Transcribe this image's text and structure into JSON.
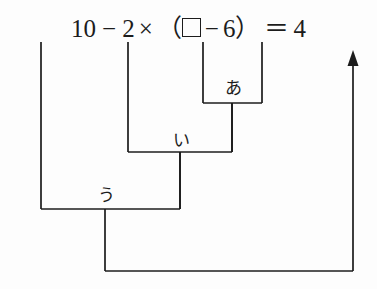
{
  "page": {
    "width": 377,
    "height": 289,
    "background_color": "#fdfdfd",
    "ink_color": "#1c1c1c"
  },
  "equation": {
    "full_text": "１０－２×（□－６）＝４",
    "tokens": [
      {
        "name": "digit-one",
        "text": "1",
        "type": "text",
        "x": 30,
        "width": 16
      },
      {
        "name": "digit-zero",
        "text": "0",
        "type": "text",
        "x": 48,
        "width": 18
      },
      {
        "name": "minus-sign-1",
        "text": "−",
        "type": "text",
        "x": 72,
        "width": 22
      },
      {
        "name": "digit-two",
        "text": "2",
        "type": "text",
        "x": 101,
        "width": 18
      },
      {
        "name": "multiply-sign",
        "text": "×",
        "type": "text",
        "x": 124,
        "width": 21
      },
      {
        "name": "paren-open",
        "text": "（",
        "type": "text",
        "x": 159,
        "width": 16
      },
      {
        "name": "answer-box",
        "text": "",
        "type": "box",
        "x": 194,
        "width": 19
      },
      {
        "name": "minus-sign-2",
        "text": "−",
        "type": "text",
        "x": 220,
        "width": 22
      },
      {
        "name": "digit-six",
        "text": "6",
        "type": "text",
        "x": 252,
        "width": 18
      },
      {
        "name": "paren-close",
        "text": "）",
        "type": "text",
        "x": 274,
        "width": 16
      },
      {
        "name": "equals-sign",
        "text": "＝",
        "type": "text",
        "x": 308,
        "width": 22
      },
      {
        "name": "digit-four",
        "text": "4",
        "type": "text",
        "x": 344,
        "width": 18
      }
    ]
  },
  "brackets": [
    {
      "name": "bracket-a",
      "label": "あ",
      "label_x": 233,
      "label_y": 88,
      "left_x": 203,
      "right_x": 262,
      "top_y": 42,
      "bottom_y": 103,
      "drop_x": 232,
      "drop_to_y": 152
    },
    {
      "name": "bracket-i",
      "label": "い",
      "label_x": 181,
      "label_y": 140,
      "left_x": 128,
      "right_x": 232,
      "top_y": 42,
      "bottom_y": 152,
      "drop_x": 180,
      "drop_to_y": 209
    },
    {
      "name": "bracket-u",
      "label": "う",
      "label_x": 106,
      "label_y": 195,
      "left_x": 41,
      "right_x": 180,
      "top_y": 42,
      "bottom_y": 209,
      "drop_x": 105,
      "drop_to_y": 271
    }
  ],
  "result_path": {
    "name": "result-arrow-path",
    "start_x": 105,
    "bottom_y": 271,
    "end_x": 353,
    "arrow_tip_y": 50,
    "arrow_head_width": 11,
    "arrow_head_height": 16
  },
  "stroke": {
    "width": 1.7,
    "color": "#1c1c1c"
  }
}
